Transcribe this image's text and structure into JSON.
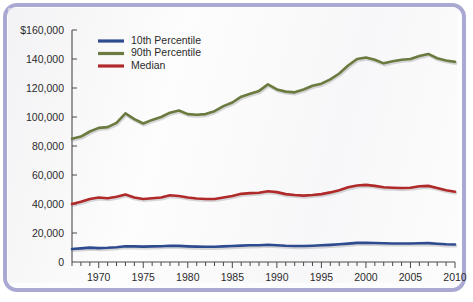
{
  "frame": {
    "border_color": "#a9a9d4",
    "background_color": "#fdfdfd"
  },
  "chart_data": {
    "type": "line",
    "title": "",
    "subtitle": "",
    "xlabel": "",
    "ylabel": "",
    "xlim": [
      1967,
      2010
    ],
    "ylim": [
      0,
      160000
    ],
    "grid": false,
    "legend_position": "top-left",
    "y_ticks": [
      0,
      20000,
      40000,
      60000,
      80000,
      100000,
      120000,
      140000,
      160000
    ],
    "y_tick_labels": [
      "0",
      "20,000",
      "40,000",
      "60,000",
      "80,000",
      "100,000",
      "120,000",
      "140,000",
      "$160,000"
    ],
    "x_ticks": [
      1967,
      1968,
      1969,
      1970,
      1971,
      1972,
      1973,
      1974,
      1975,
      1976,
      1977,
      1978,
      1979,
      1980,
      1981,
      1982,
      1983,
      1984,
      1985,
      1986,
      1987,
      1988,
      1989,
      1990,
      1991,
      1992,
      1993,
      1994,
      1995,
      1996,
      1997,
      1998,
      1999,
      2000,
      2001,
      2002,
      2003,
      2004,
      2005,
      2006,
      2007,
      2008,
      2009,
      2010
    ],
    "x_tick_labels": [
      "1970",
      "1975",
      "1980",
      "1985",
      "1990",
      "1995",
      "2000",
      "2005",
      "2010"
    ],
    "x_labeled_ticks": [
      1970,
      1975,
      1980,
      1985,
      1990,
      1995,
      2000,
      2005,
      2010
    ],
    "x": [
      1967,
      1968,
      1969,
      1970,
      1971,
      1972,
      1973,
      1974,
      1975,
      1976,
      1977,
      1978,
      1979,
      1980,
      1981,
      1982,
      1983,
      1984,
      1985,
      1986,
      1987,
      1988,
      1989,
      1990,
      1991,
      1992,
      1993,
      1994,
      1995,
      1996,
      1997,
      1998,
      1999,
      2000,
      2001,
      2002,
      2003,
      2004,
      2005,
      2006,
      2007,
      2008,
      2009,
      2010
    ],
    "series": [
      {
        "name": "10th Percentile",
        "color": "#2e4b8f",
        "values": [
          9000,
          9400,
          9900,
          9600,
          9800,
          10200,
          10900,
          10800,
          10600,
          10800,
          10900,
          11200,
          11100,
          10800,
          10600,
          10500,
          10500,
          10800,
          11000,
          11300,
          11500,
          11600,
          11900,
          11600,
          11200,
          11000,
          11000,
          11200,
          11500,
          11800,
          12200,
          12700,
          13200,
          13300,
          13100,
          12900,
          12800,
          12800,
          12800,
          12900,
          13000,
          12600,
          12200,
          12100
        ]
      },
      {
        "name": "90th Percentile",
        "color": "#6b7a3f",
        "values": [
          85000,
          86500,
          90000,
          92500,
          93000,
          96000,
          102500,
          98500,
          95500,
          98000,
          100000,
          103000,
          104500,
          102000,
          101500,
          102000,
          104000,
          107500,
          110000,
          114000,
          116000,
          118000,
          122500,
          119000,
          117500,
          117000,
          119000,
          121500,
          123000,
          126000,
          130000,
          135500,
          140000,
          141000,
          139500,
          137000,
          138500,
          139500,
          140000,
          142000,
          143500,
          140500,
          139000,
          138000
        ]
      },
      {
        "name": "Median",
        "color": "#b02a2a",
        "values": [
          40000,
          41500,
          43500,
          44500,
          44000,
          45000,
          46500,
          44500,
          43500,
          44000,
          44500,
          46000,
          45500,
          44500,
          43800,
          43500,
          43500,
          44500,
          45500,
          47000,
          47500,
          47800,
          48800,
          48200,
          46800,
          46200,
          45800,
          46200,
          46800,
          48000,
          49500,
          51500,
          52800,
          53200,
          52500,
          51500,
          51200,
          51000,
          51200,
          52200,
          52500,
          51000,
          49500,
          48500
        ]
      }
    ]
  },
  "legend": {
    "items": [
      {
        "label": "10th Percentile",
        "color": "#2e4b8f"
      },
      {
        "label": "90th Percentile",
        "color": "#6b7a3f"
      },
      {
        "label": "Median",
        "color": "#b02a2a"
      }
    ]
  }
}
